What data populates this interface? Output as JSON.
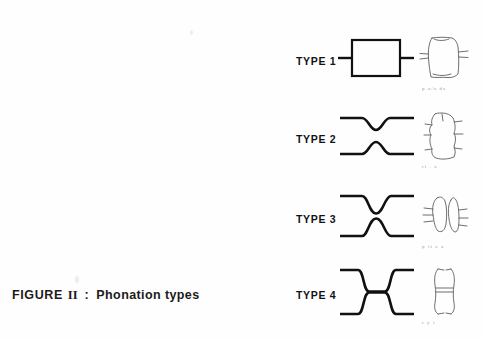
{
  "figure": {
    "caption_prefix": "FIGURE",
    "caption_numeral": "II",
    "caption_separator": ":",
    "caption_subject": "Phonation types"
  },
  "rows": [
    {
      "label": "TYPE 1",
      "aperture_shape": "open-rectangle",
      "aperture_description": "wide open glottis drawn as a rectangle with horizontal lines entering at mid-height on both sides",
      "sketch_name": "glottis-sketch-type-1",
      "sketch_caption": "p a/a dz"
    },
    {
      "label": "TYPE 2",
      "aperture_shape": "narrowed-gap",
      "aperture_description": "upper line dips and lower line rises leaving a narrow gap between them",
      "sketch_name": "glottis-sketch-type-2",
      "sketch_caption": "ri . a"
    },
    {
      "label": "TYPE 3",
      "aperture_shape": "slit",
      "aperture_description": "upper and lower lines converge into a very narrow slit at the centre",
      "sketch_name": "glottis-sketch-type-3",
      "sketch_caption": "p it z a"
    },
    {
      "label": "TYPE 4",
      "aperture_shape": "closed",
      "aperture_description": "upper and lower lines meet and run together as a single closed segment",
      "sketch_name": "glottis-sketch-type-4",
      "sketch_caption": "r y i"
    }
  ],
  "colors": {
    "background": "#fefefe",
    "ink": "#111111",
    "hand_drawn_ink": "#5d5d5d",
    "faint_text": "#8e8e8e"
  }
}
